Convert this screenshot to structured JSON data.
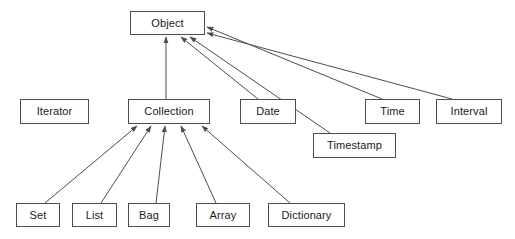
{
  "diagram": {
    "type": "class-hierarchy",
    "notation": "generalization-arrows",
    "background_color": "#ffffff",
    "box_border_color": "#4d4d4d",
    "box_fill_color": "#ffffff",
    "edge_color": "#4d4d4d",
    "text_color": "#1a1a1a",
    "canvas": {
      "width": 515,
      "height": 239
    },
    "nodes": [
      {
        "id": "object",
        "label": "Object",
        "x": 130,
        "y": 11,
        "w": 75,
        "h": 24
      },
      {
        "id": "iterator",
        "label": "Iterator",
        "x": 20,
        "y": 99,
        "w": 69,
        "h": 25
      },
      {
        "id": "collection",
        "label": "Collection",
        "x": 128,
        "y": 99,
        "w": 82,
        "h": 25
      },
      {
        "id": "date",
        "label": "Date",
        "x": 240,
        "y": 99,
        "w": 56,
        "h": 25
      },
      {
        "id": "time",
        "label": "Time",
        "x": 365,
        "y": 99,
        "w": 55,
        "h": 25
      },
      {
        "id": "interval",
        "label": "Interval",
        "x": 436,
        "y": 99,
        "w": 66,
        "h": 25
      },
      {
        "id": "timestamp",
        "label": "Timestamp",
        "x": 313,
        "y": 133,
        "w": 83,
        "h": 25
      },
      {
        "id": "set",
        "label": "Set",
        "x": 16,
        "y": 203,
        "w": 44,
        "h": 24
      },
      {
        "id": "list",
        "label": "List",
        "x": 72,
        "y": 203,
        "w": 45,
        "h": 24
      },
      {
        "id": "bag",
        "label": "Bag",
        "x": 128,
        "y": 203,
        "w": 42,
        "h": 24
      },
      {
        "id": "array",
        "label": "Array",
        "x": 196,
        "y": 203,
        "w": 54,
        "h": 24
      },
      {
        "id": "dictionary",
        "label": "Dictionary",
        "x": 268,
        "y": 203,
        "w": 77,
        "h": 24
      }
    ],
    "edges": [
      {
        "from": "collection",
        "to": "object",
        "x1": 166,
        "y1": 99,
        "x2": 166,
        "y2": 37
      },
      {
        "from": "date",
        "to": "object",
        "x1": 258,
        "y1": 99,
        "x2": 181,
        "y2": 37
      },
      {
        "from": "timestamp",
        "to": "object",
        "x1": 330,
        "y1": 133,
        "x2": 190,
        "y2": 37
      },
      {
        "from": "time",
        "to": "object",
        "x1": 382,
        "y1": 99,
        "x2": 207,
        "y2": 27
      },
      {
        "from": "interval",
        "to": "object",
        "x1": 452,
        "y1": 99,
        "x2": 207,
        "y2": 33
      },
      {
        "from": "set",
        "to": "collection",
        "x1": 45,
        "y1": 203,
        "x2": 137,
        "y2": 126
      },
      {
        "from": "list",
        "to": "collection",
        "x1": 101,
        "y1": 203,
        "x2": 151,
        "y2": 126
      },
      {
        "from": "bag",
        "to": "collection",
        "x1": 156,
        "y1": 203,
        "x2": 165,
        "y2": 126
      },
      {
        "from": "array",
        "to": "collection",
        "x1": 216,
        "y1": 203,
        "x2": 181,
        "y2": 126
      },
      {
        "from": "dictionary",
        "to": "collection",
        "x1": 290,
        "y1": 203,
        "x2": 202,
        "y2": 126
      }
    ]
  }
}
